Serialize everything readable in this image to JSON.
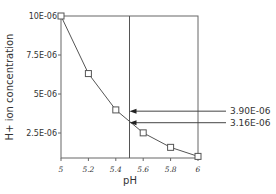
{
  "chart_data": {
    "type": "line",
    "title": "",
    "xlabel": "pH",
    "ylabel": "H+ ion concentration",
    "x": [
      5,
      5.2,
      5.4,
      5.6,
      5.8,
      6
    ],
    "series": [
      {
        "name": "H+ ion concentration",
        "values": [
          1e-05,
          6.31e-06,
          3.98e-06,
          2.51e-06,
          1.58e-06,
          1e-06
        ],
        "marker": "square"
      }
    ],
    "xticks": [
      "5",
      "5.2",
      "5.4",
      "5.6",
      "5.8",
      "6"
    ],
    "yticks": [
      "2.5E-06",
      "5E-06",
      "7.5E-06",
      "10E-06"
    ],
    "xlim": [
      5,
      6
    ],
    "ylim": [
      9e-07,
      1e-05
    ],
    "grid": false,
    "legend": null,
    "annotations": [
      {
        "type": "vline",
        "x": 5.5
      },
      {
        "type": "arrow",
        "y": 3.9e-06,
        "label": "3.90E-06"
      },
      {
        "type": "arrow",
        "y": 3.16e-06,
        "label": "3.16E-06"
      }
    ]
  }
}
